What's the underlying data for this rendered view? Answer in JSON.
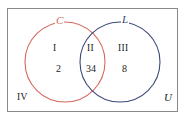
{
  "diagram": {
    "type": "venn-two-set",
    "universe_label": "U",
    "outer_region_numeral": "IV",
    "sets": [
      {
        "key": "C",
        "label": "C",
        "color": "#d4695e",
        "cx": 65,
        "cy": 62,
        "r": 40
      },
      {
        "key": "L",
        "label": "L",
        "color": "#3b4a77",
        "cx": 120,
        "cy": 62,
        "r": 40
      }
    ],
    "regions": [
      {
        "numeral": "I",
        "count": "2",
        "description": "C only"
      },
      {
        "numeral": "II",
        "count": "34",
        "description": "C and L"
      },
      {
        "numeral": "III",
        "count": "8",
        "description": "L only"
      },
      {
        "numeral": "IV",
        "count": "",
        "description": "outside both sets"
      }
    ],
    "border_color": "#8a8a8a",
    "background_color": "#ffffff",
    "text_color": "#1a1a1a"
  }
}
